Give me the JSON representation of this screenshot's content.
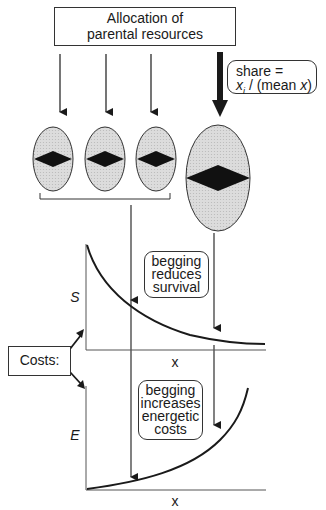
{
  "top_box": {
    "line1": "Allocation of",
    "line2": "parental resources"
  },
  "share_box": {
    "line1": "share =",
    "line2_var": "x",
    "line2_sub": "i",
    "line2_rest": " / (mean ",
    "line2_var2": "x",
    "line2_end": ")"
  },
  "survival_box": {
    "line1": "begging",
    "line2": "reduces",
    "line3": "survival"
  },
  "energy_box": {
    "line1": "begging",
    "line2": "increases",
    "line3": "energetic",
    "line4": "costs"
  },
  "costs_box": {
    "label": "Costs:"
  },
  "survival_plot": {
    "ylabel": "S",
    "xlabel": "x"
  },
  "energy_plot": {
    "ylabel": "E",
    "xlabel": "x"
  },
  "colors": {
    "ink": "#1a1a1a",
    "egg_fill": "#d6d6d6"
  }
}
